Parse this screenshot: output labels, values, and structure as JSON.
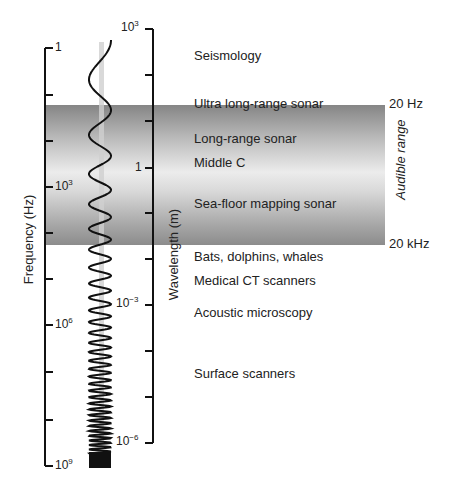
{
  "chart_data": {
    "type": "diagram",
    "title": "",
    "axes": {
      "frequency": {
        "label": "Frequency (Hz)",
        "ticks": [
          {
            "base": "1",
            "exp": ""
          },
          {
            "base": "10",
            "exp": "3"
          },
          {
            "base": "10",
            "exp": "6"
          },
          {
            "base": "10",
            "exp": "9"
          }
        ]
      },
      "wavelength": {
        "label": "Wavelength (m)",
        "ticks": [
          {
            "base": "10",
            "exp": "3"
          },
          {
            "base": "1",
            "exp": ""
          },
          {
            "base": "10",
            "exp": "−3"
          },
          {
            "base": "10",
            "exp": "−6"
          }
        ]
      }
    },
    "audible_band": {
      "label": "Audible range",
      "top": "20 Hz",
      "bottom": "20 kHz"
    },
    "applications": [
      "Seismology",
      "Ultra long-range sonar",
      "Long-range sonar",
      "Middle C",
      "Sea-floor mapping sonar",
      "Bats, dolphins, whales",
      "Medical CT scanners",
      "Acoustic microscopy",
      "Surface scanners"
    ]
  }
}
